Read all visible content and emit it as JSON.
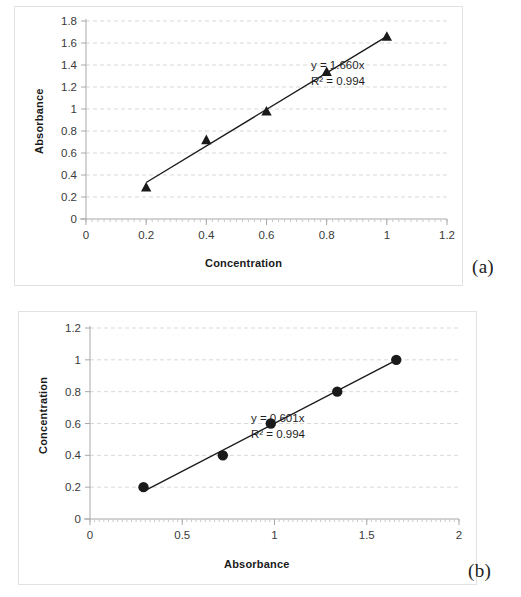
{
  "figure": {
    "panels": [
      {
        "caption": "(a)",
        "equation_line1": "y = 1.660x",
        "equation_line2": "R² = 0.994"
      },
      {
        "caption": "(b)",
        "equation_line1": "y = 0.601x",
        "equation_line2": "R² = 0.994"
      }
    ]
  },
  "chart_data": [
    {
      "type": "scatter",
      "title": "",
      "xlabel": "Concentration",
      "ylabel": "Absorbance",
      "xlim": [
        0,
        1.2
      ],
      "ylim": [
        0,
        1.8
      ],
      "xticks": [
        "0",
        "0.2",
        "0.4",
        "0.6",
        "0.8",
        "1",
        "1.2"
      ],
      "xtick_values": [
        0,
        0.2,
        0.4,
        0.6,
        0.8,
        1,
        1.2
      ],
      "yticks": [
        "0",
        "0.2",
        "0.4",
        "0.6",
        "0.8",
        "1",
        "1.2",
        "1.4",
        "1.6",
        "1.8"
      ],
      "ytick_values": [
        0,
        0.2,
        0.4,
        0.6,
        0.8,
        1,
        1.2,
        1.4,
        1.6,
        1.8
      ],
      "grid": "horizontal-dashed",
      "legend": "none",
      "marker": "triangle",
      "x": [
        0.2,
        0.4,
        0.6,
        0.8,
        1.0
      ],
      "y": [
        0.29,
        0.72,
        0.98,
        1.34,
        1.66
      ],
      "trendline": {
        "equation": "y = 1.660x",
        "slope": 1.66,
        "intercept": 0,
        "r_squared": 0.994,
        "r_squared_label": "R² = 0.994",
        "x_from": 0.2,
        "x_to": 1.0
      }
    },
    {
      "type": "scatter",
      "title": "",
      "xlabel": "Absorbance",
      "ylabel": "Concentration",
      "xlim": [
        0,
        2
      ],
      "ylim": [
        0,
        1.2
      ],
      "xticks": [
        "0",
        "0.5",
        "1",
        "1.5",
        "2"
      ],
      "xtick_values": [
        0,
        0.5,
        1,
        1.5,
        2
      ],
      "yticks": [
        "0",
        "0.2",
        "0.4",
        "0.6",
        "0.8",
        "1",
        "1.2"
      ],
      "ytick_values": [
        0,
        0.2,
        0.4,
        0.6,
        0.8,
        1,
        1.2
      ],
      "grid": "horizontal-dashed",
      "legend": "none",
      "marker": "circle",
      "x": [
        0.29,
        0.72,
        0.98,
        1.34,
        1.66
      ],
      "y": [
        0.2,
        0.4,
        0.6,
        0.8,
        1.0
      ],
      "trendline": {
        "equation": "y = 0.601x",
        "slope": 0.601,
        "intercept": 0,
        "r_squared": 0.994,
        "r_squared_label": "R² = 0.994",
        "x_from": 0.29,
        "x_to": 1.66
      }
    }
  ]
}
